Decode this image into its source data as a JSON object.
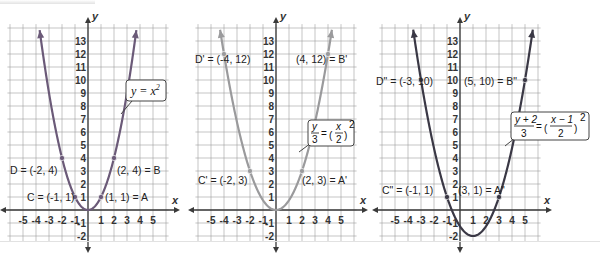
{
  "figure": {
    "graphs": [
      {
        "id": "g1",
        "equation": "y = x²",
        "equation_parts": {
          "lhs": "y = x",
          "exp": "2"
        },
        "curve_color": "#6b5a78",
        "axis_labels": {
          "x": "x",
          "y": "y"
        },
        "x_ticks": [
          "-5",
          "-4",
          "-3",
          "-2",
          "-1",
          "1",
          "2",
          "3",
          "4",
          "5"
        ],
        "y_ticks": [
          "13",
          "12",
          "11",
          "10",
          "9",
          "8",
          "7",
          "6",
          "5",
          "4",
          "3",
          "2",
          "1",
          "-1",
          "-2"
        ],
        "points": [
          {
            "name": "A",
            "label": "(1, 1) = A",
            "x": 1,
            "y": 1
          },
          {
            "name": "B",
            "label": "(2, 4) = B",
            "x": 2,
            "y": 4
          },
          {
            "name": "C",
            "label": "C = (-1, 1)",
            "x": -1,
            "y": 1
          },
          {
            "name": "D",
            "label": "D = (-2, 4)",
            "x": -2,
            "y": 4
          }
        ]
      },
      {
        "id": "g2",
        "equation": "y/3 = (x/2)²",
        "equation_parts": {
          "lhs_num": "y",
          "lhs_den": "3",
          "rhs_num": "x",
          "rhs_den": "2",
          "exp": "2"
        },
        "curve_color": "#9a9a9c",
        "axis_labels": {
          "x": "x",
          "y": "y"
        },
        "x_ticks": [
          "-5",
          "-4",
          "-3",
          "-2",
          "-1",
          "1",
          "2",
          "3",
          "4",
          "5"
        ],
        "y_ticks": [
          "13",
          "12",
          "11",
          "10",
          "9",
          "8",
          "7",
          "6",
          "5",
          "4",
          "3",
          "2",
          "1",
          "-1",
          "-2"
        ],
        "points": [
          {
            "name": "A'",
            "label": "(2, 3) = A'",
            "x": 2,
            "y": 3
          },
          {
            "name": "B'",
            "label": "(4, 12) = B'",
            "x": 4,
            "y": 12
          },
          {
            "name": "C'",
            "label": "C' = (-2, 3)",
            "x": -2,
            "y": 3
          },
          {
            "name": "D'",
            "label": "D' = (-4, 12)",
            "x": -4,
            "y": 12
          }
        ]
      },
      {
        "id": "g3",
        "equation": "(y + 2)/3 = ((x − 1)/2)²",
        "equation_parts": {
          "lhs_num": "y + 2",
          "lhs_den": "3",
          "rhs_num": "x − 1",
          "rhs_den": "2",
          "exp": "2"
        },
        "curve_color": "#3a3845",
        "axis_labels": {
          "x": "x",
          "y": "y"
        },
        "x_ticks": [
          "-5",
          "-4",
          "-3",
          "-2",
          "-1",
          "1",
          "2",
          "3",
          "4",
          "5"
        ],
        "y_ticks": [
          "13",
          "12",
          "11",
          "10",
          "9",
          "8",
          "7",
          "6",
          "5",
          "4",
          "3",
          "2",
          "1",
          "-1",
          "-2"
        ],
        "points": [
          {
            "name": "A\"",
            "label": "(3, 1) = A\"",
            "x": 3,
            "y": 1
          },
          {
            "name": "B\"",
            "label": "(5, 10) = B\"",
            "x": 5,
            "y": 10
          },
          {
            "name": "C\"",
            "label": "C\" = (-1, 1)",
            "x": -1,
            "y": 1
          },
          {
            "name": "D\"",
            "label": "D\" = (-3, 10)",
            "x": -3,
            "y": 10
          }
        ]
      }
    ],
    "colors": {
      "grid": "#9c9c9c",
      "axis": "#3a3a3a",
      "text": "#222222"
    }
  }
}
